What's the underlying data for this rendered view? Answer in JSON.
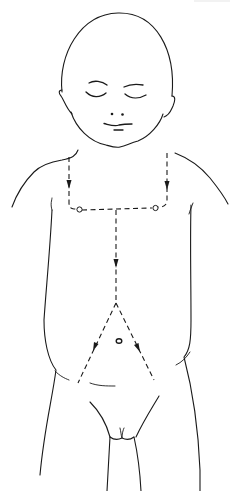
{
  "figure": {
    "type": "line-art diagram",
    "line_color": "#1a1a1a",
    "background": "#ffffff",
    "elements": {
      "head": "head-outline",
      "face": [
        "left-eye-closed",
        "right-eye-closed",
        "nose",
        "mouth"
      ],
      "landmarks": [
        "left-nipple",
        "right-nipple",
        "navel"
      ],
      "paths": [
        {
          "name": "left-clavicular-path",
          "style": "dashed",
          "direction": "down",
          "arrows": 1
        },
        {
          "name": "right-clavicular-path",
          "style": "dashed",
          "direction": "down",
          "arrows": 1
        },
        {
          "name": "intermammary-path",
          "style": "dashed",
          "direction": "horizontal",
          "arrows": 0
        },
        {
          "name": "midline-path",
          "style": "dashed",
          "direction": "down",
          "arrows": 1
        },
        {
          "name": "left-inguinal-path",
          "style": "dashed",
          "direction": "down-left",
          "arrows": 1
        },
        {
          "name": "right-inguinal-path",
          "style": "dashed",
          "direction": "down-right",
          "arrows": 1
        }
      ]
    }
  }
}
